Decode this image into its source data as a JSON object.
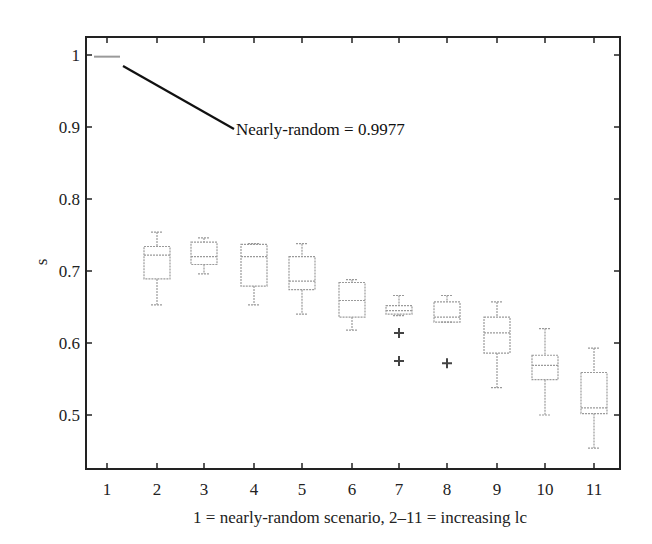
{
  "chart_data": {
    "type": "box",
    "title": "",
    "xlabel": "1 = nearly-random scenario, 2–11 = increasing lc",
    "ylabel": "s",
    "categories": [
      "1",
      "2",
      "3",
      "4",
      "5",
      "6",
      "7",
      "8",
      "9",
      "10",
      "11"
    ],
    "yticks": [
      "0.5",
      "0.6",
      "0.7",
      "0.8",
      "0.9",
      "1"
    ],
    "ylim": [
      0.45,
      1.025
    ],
    "grid": false,
    "boxes": [
      {
        "x": "1",
        "whisker_low": 0.9965,
        "q1": 0.9972,
        "median": 0.9977,
        "q3": 0.9982,
        "whisker_high": 0.9988,
        "outliers": []
      },
      {
        "x": "2",
        "whisker_low": 0.653,
        "q1": 0.689,
        "median": 0.722,
        "q3": 0.734,
        "whisker_high": 0.754,
        "outliers": []
      },
      {
        "x": "3",
        "whisker_low": 0.696,
        "q1": 0.709,
        "median": 0.72,
        "q3": 0.74,
        "whisker_high": 0.746,
        "outliers": []
      },
      {
        "x": "4",
        "whisker_low": 0.653,
        "q1": 0.679,
        "median": 0.72,
        "q3": 0.737,
        "whisker_high": 0.738,
        "outliers": []
      },
      {
        "x": "5",
        "whisker_low": 0.64,
        "q1": 0.674,
        "median": 0.686,
        "q3": 0.72,
        "whisker_high": 0.738,
        "outliers": []
      },
      {
        "x": "6",
        "whisker_low": 0.618,
        "q1": 0.636,
        "median": 0.659,
        "q3": 0.684,
        "whisker_high": 0.688,
        "outliers": []
      },
      {
        "x": "7",
        "whisker_low": 0.638,
        "q1": 0.64,
        "median": 0.645,
        "q3": 0.652,
        "whisker_high": 0.666,
        "outliers": [
          0.614,
          0.575
        ]
      },
      {
        "x": "8",
        "whisker_low": 0.629,
        "q1": 0.629,
        "median": 0.636,
        "q3": 0.657,
        "whisker_high": 0.666,
        "outliers": [
          0.572
        ]
      },
      {
        "x": "9",
        "whisker_low": 0.538,
        "q1": 0.586,
        "median": 0.614,
        "q3": 0.636,
        "whisker_high": 0.657,
        "outliers": []
      },
      {
        "x": "10",
        "whisker_low": 0.5,
        "q1": 0.549,
        "median": 0.569,
        "q3": 0.583,
        "whisker_high": 0.62,
        "outliers": []
      },
      {
        "x": "11",
        "whisker_low": 0.454,
        "q1": 0.502,
        "median": 0.51,
        "q3": 0.559,
        "whisker_high": 0.593,
        "outliers": []
      }
    ],
    "annotations": [
      {
        "text": "Nearly-random = 0.9977",
        "points_to": "1"
      }
    ]
  },
  "colors": {
    "axis": "#222222",
    "box": "#9a9a9a",
    "outlier": "#444444",
    "annotation_line": "#111111"
  }
}
